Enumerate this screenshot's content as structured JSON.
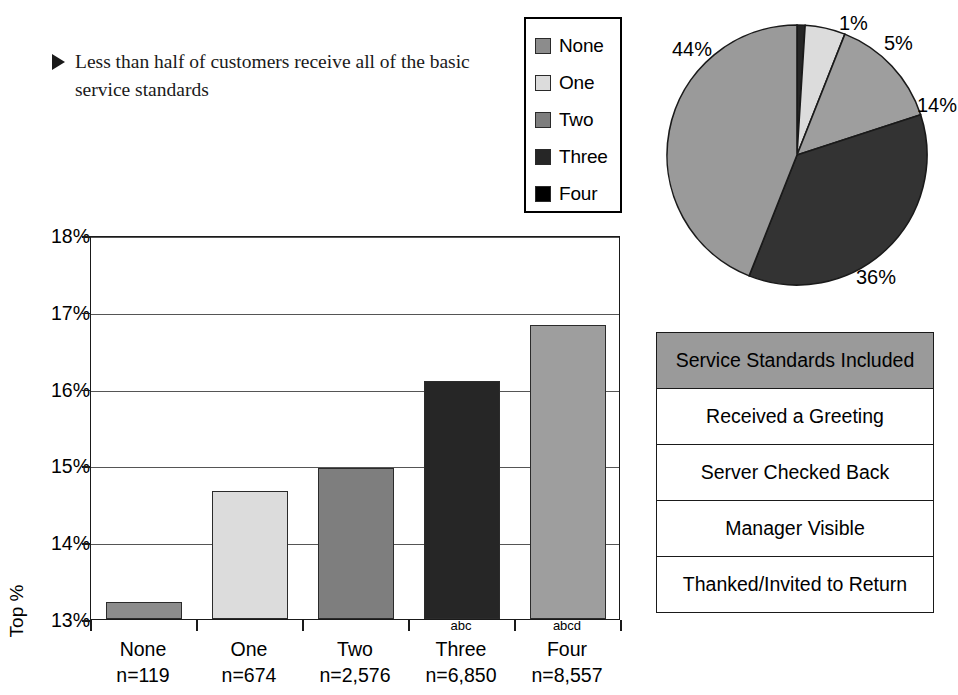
{
  "callout": {
    "bullet_icon": "triangle-right-icon",
    "text": "Less than half of customers receive all of the basic service standards"
  },
  "legend": {
    "items": [
      {
        "label": "None",
        "color": "#8c8c8c"
      },
      {
        "label": "One",
        "color": "#dcdcdc"
      },
      {
        "label": "Two",
        "color": "#7e7e7e"
      },
      {
        "label": "Three",
        "color": "#262626"
      },
      {
        "label": "Four",
        "color": "#000000"
      }
    ]
  },
  "table": {
    "header": "Service Standards Included",
    "header_color": "#9a9a9a",
    "rows": [
      "Received a Greeting",
      "Server Checked Back",
      "Manager Visible",
      "Thanked/Invited to Return"
    ]
  },
  "chart_data": [
    {
      "type": "bar",
      "title": "",
      "xlabel": "",
      "ylabel": "Top %",
      "ylim": [
        13,
        18
      ],
      "yticks": [
        "13%",
        "14%",
        "15%",
        "16%",
        "17%",
        "18%"
      ],
      "grid": true,
      "categories": [
        "None",
        "One",
        "Two",
        "Three",
        "Four"
      ],
      "category_notes": [
        "n=119",
        "n=674",
        "n=2,576",
        "n=6,850",
        "n=8,557"
      ],
      "significance_marks": [
        "",
        "",
        "",
        "abc",
        "abcd"
      ],
      "values": [
        13.22,
        14.67,
        14.97,
        16.1,
        16.83
      ],
      "bar_colors": [
        "#8c8c8c",
        "#dcdcdc",
        "#7e7e7e",
        "#262626",
        "#9e9e9e"
      ]
    },
    {
      "type": "pie",
      "title": "",
      "legend_position": "left",
      "labels": [
        "None",
        "One",
        "Two",
        "Three",
        "Four"
      ],
      "values": [
        1,
        5,
        14,
        36,
        44
      ],
      "value_labels": [
        "1%",
        "5%",
        "14%",
        "36%",
        "44%"
      ],
      "colors": [
        "#262626",
        "#dcdcdc",
        "#9e9e9e",
        "#333333",
        "#9a9a9a"
      ]
    }
  ]
}
